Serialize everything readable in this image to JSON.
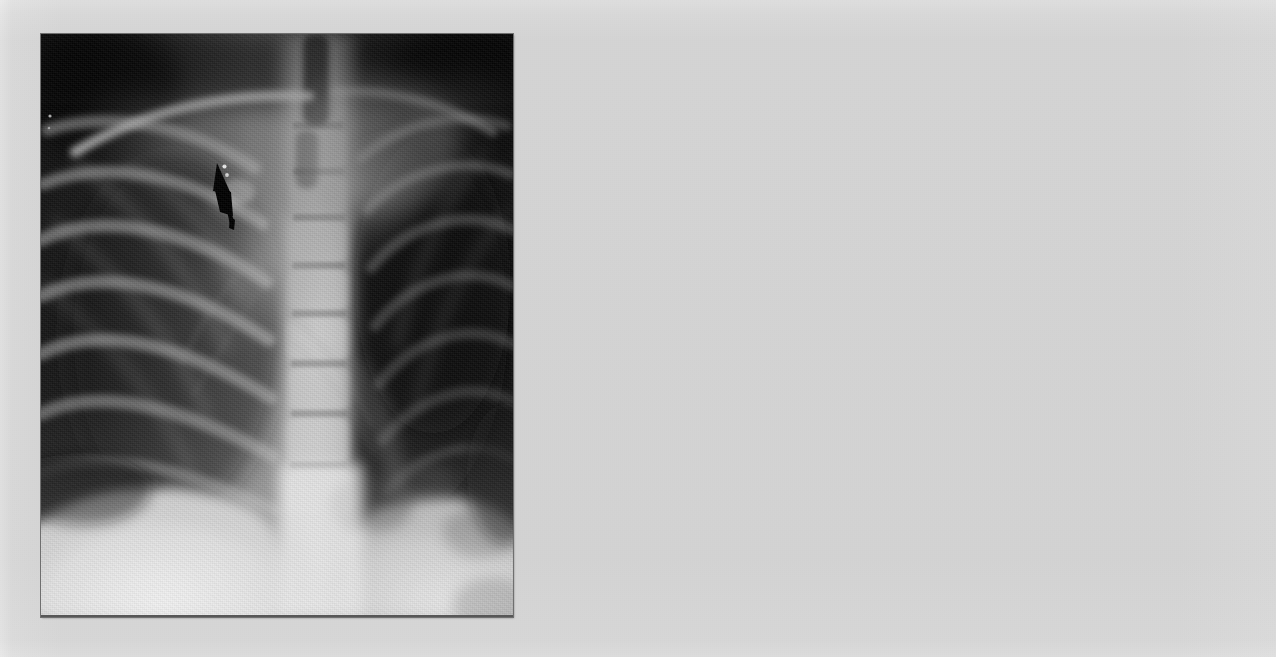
{
  "page": {
    "background_color": "#e9e9e9",
    "width": 1276,
    "height": 657,
    "caption": "",
    "blank_region_label": ""
  },
  "figure": {
    "name": "chest-radiograph",
    "modality": "X-ray",
    "view": "posteroanterior chest radiograph",
    "frame": {
      "x": 41,
      "y": 34,
      "width": 472,
      "height": 583
    },
    "border_color": "#6f6f6f",
    "background_color": "#0d0d0d"
  },
  "annotations": [
    {
      "name": "lesion-arrow",
      "type": "arrow",
      "color": "#000000",
      "tip": {
        "x": 178,
        "y": 178
      },
      "tail": {
        "x": 188,
        "y": 228
      },
      "points_to": "right upper lung zone opacity",
      "label": ""
    }
  ],
  "anatomy": {
    "structures": [
      "right clavicle",
      "right ribs",
      "left ribs",
      "thoracic spine",
      "right hemidiaphragm",
      "left hemidiaphragm",
      "right lung field",
      "left lung field",
      "mediastinum"
    ],
    "findings": "Nodular opacity in right upper lung zone marked by arrow"
  },
  "colors": {
    "page_background": "#e9e9e9",
    "page_highlight": "#f4f4f4",
    "film_dark": "#111111",
    "film_mid": "#6b6b6b",
    "film_bright": "#e2e2e2",
    "annotation": "#000000",
    "frame_border": "#6f6f6f"
  }
}
